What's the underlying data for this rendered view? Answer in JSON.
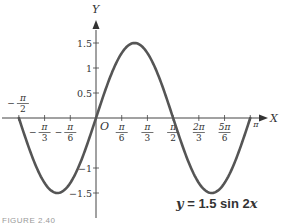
{
  "chart_data": {
    "type": "line",
    "title": "",
    "equation": "y = 1.5 sin 2x",
    "xlabel": "X",
    "ylabel": "Y",
    "x_ticks": [
      {
        "value": -1.5708,
        "label": "−π/2"
      },
      {
        "value": -1.0472,
        "label": "−π/3"
      },
      {
        "value": -0.5236,
        "label": "−π/6"
      },
      {
        "value": 0,
        "label": "O"
      },
      {
        "value": 0.5236,
        "label": "π/6"
      },
      {
        "value": 1.0472,
        "label": "π/3"
      },
      {
        "value": 1.5708,
        "label": "π/2"
      },
      {
        "value": 2.0944,
        "label": "2π/3"
      },
      {
        "value": 2.618,
        "label": "5π/6"
      },
      {
        "value": 3.1416,
        "label": "π"
      }
    ],
    "y_ticks": [
      {
        "value": 1.5,
        "label": "1.5"
      },
      {
        "value": 1,
        "label": "1"
      },
      {
        "value": 0.5,
        "label": "0.5"
      },
      {
        "value": -1,
        "label": "−1"
      },
      {
        "value": -1.5,
        "label": "−1.5"
      }
    ],
    "xlim": [
      -1.5708,
      3.1416
    ],
    "ylim": [
      -1.5,
      1.5
    ],
    "series": [
      {
        "name": "y = 1.5 sin 2x",
        "x": [
          -1.5708,
          -1.309,
          -1.0472,
          -0.7854,
          -0.5236,
          -0.2618,
          0,
          0.2618,
          0.5236,
          0.7854,
          1.0472,
          1.309,
          1.5708,
          1.8326,
          2.0944,
          2.3562,
          2.618,
          2.8798,
          3.1416
        ],
        "values": [
          0,
          -0.75,
          -1.299,
          -1.5,
          -1.299,
          -0.75,
          0,
          0.75,
          1.299,
          1.5,
          1.299,
          0.75,
          0,
          -0.75,
          -1.299,
          -1.5,
          -1.299,
          -0.75,
          0
        ]
      }
    ],
    "grid": false,
    "legend": "none"
  },
  "caption": "FIGURE 2.40",
  "equation_label": {
    "lhs": "y",
    "rhs_num": " = 1.5 sin 2",
    "var": "x"
  }
}
